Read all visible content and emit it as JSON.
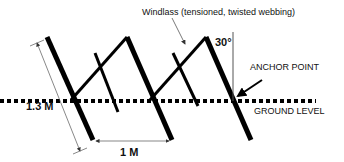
{
  "labels": {
    "windlass": "Windlass (tensioned, twisted webbing)",
    "angle": "30°",
    "anchor_point": "ANCHOR POINT",
    "ground_level": "GROUND LEVEL",
    "post_length": "1.3 M",
    "post_spacing": "1 M"
  },
  "colors": {
    "stroke": "#000000",
    "thin": "#555555",
    "background": "#ffffff"
  }
}
